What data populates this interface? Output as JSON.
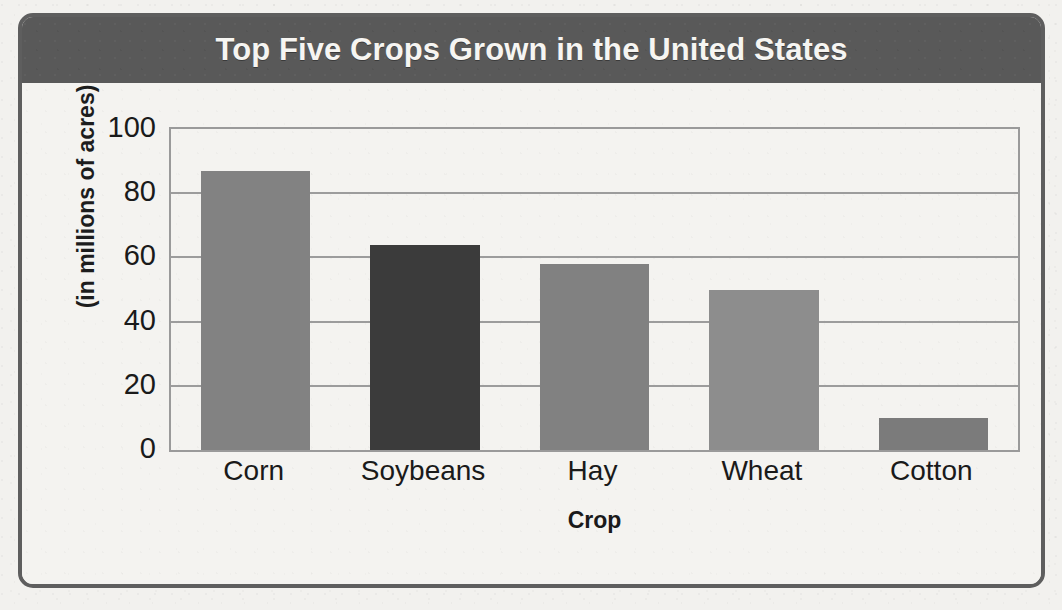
{
  "chart_data": {
    "type": "bar",
    "title": "Top Five Crops Grown in the United States",
    "xlabel": "Crop",
    "ylabel": "(in millions of acres)",
    "categories": [
      "Corn",
      "Soybeans",
      "Hay",
      "Wheat",
      "Cotton"
    ],
    "values": [
      87,
      64,
      58,
      50,
      10
    ],
    "bar_colors": [
      "#828282",
      "#3b3b3b",
      "#818181",
      "#8d8d8d",
      "#7b7b7b"
    ],
    "ylim": [
      0,
      100
    ],
    "yticks": [
      0,
      20,
      40,
      60,
      80,
      100
    ],
    "ytick_labels": [
      "0",
      "20",
      "40",
      "60",
      "80",
      "100"
    ],
    "grid": true,
    "legend": "none"
  },
  "frame": {
    "title_bar_color": "#595959",
    "title_text_color": "#f6f5f2",
    "border_color": "#5e5e5e",
    "paper_color": "#f2f1ee",
    "gridline_color": "#9c9c9c"
  }
}
